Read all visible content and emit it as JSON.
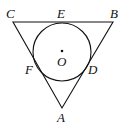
{
  "diagram": {
    "type": "geometry",
    "stroke_color": "#111111",
    "background": "#ffffff",
    "points": {
      "A": {
        "label": "A",
        "x": 62,
        "y": 108
      },
      "B": {
        "label": "B",
        "x": 113,
        "y": 22
      },
      "C": {
        "label": "C",
        "x": 13,
        "y": 22
      },
      "D": {
        "label": "D",
        "x": 87,
        "y": 66
      },
      "E": {
        "label": "E",
        "x": 62,
        "y": 22
      },
      "F": {
        "label": "F",
        "x": 37,
        "y": 66
      },
      "O": {
        "label": "O",
        "x": 62,
        "y": 52
      }
    },
    "circle": {
      "center": "O",
      "r": 29
    },
    "segments": [
      [
        "C",
        "B"
      ],
      [
        "B",
        "A"
      ],
      [
        "A",
        "C"
      ]
    ]
  }
}
